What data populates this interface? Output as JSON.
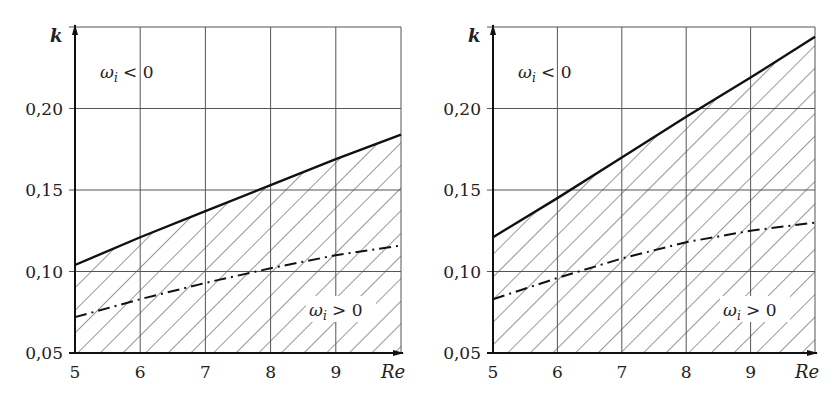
{
  "chart_data": [
    {
      "type": "line",
      "title": "",
      "xlabel": "Re",
      "ylabel": "k",
      "xlim": [
        5,
        10
      ],
      "ylim": [
        0.05,
        0.25
      ],
      "x_ticks": [
        "5",
        "6",
        "7",
        "8",
        "9"
      ],
      "y_ticks": [
        "0,05",
        "0,10",
        "0,15",
        "0,20"
      ],
      "grid": true,
      "annotations": [
        "ωi < 0",
        "ωi > 0"
      ],
      "series": [
        {
          "name": "neutral stability boundary (solid)",
          "style": "solid",
          "x": [
            5,
            6,
            7,
            8,
            9,
            10
          ],
          "values": [
            0.104,
            0.121,
            0.137,
            0.153,
            0.169,
            0.184
          ]
        },
        {
          "name": "dash-dot curve",
          "style": "dashdot",
          "x": [
            5,
            6,
            7,
            8,
            9,
            10
          ],
          "values": [
            0.072,
            0.083,
            0.093,
            0.102,
            0.11,
            0.116
          ]
        }
      ],
      "hatched_region": "below solid line (ωi > 0)"
    },
    {
      "type": "line",
      "title": "",
      "xlabel": "Re",
      "ylabel": "k",
      "xlim": [
        5,
        10
      ],
      "ylim": [
        0.05,
        0.25
      ],
      "x_ticks": [
        "5",
        "6",
        "7",
        "8",
        "9"
      ],
      "y_ticks": [
        "0,05",
        "0,10",
        "0,15",
        "0,20"
      ],
      "grid": true,
      "annotations": [
        "ωi < 0",
        "ωi > 0"
      ],
      "series": [
        {
          "name": "neutral stability boundary (solid)",
          "style": "solid",
          "x": [
            5,
            6,
            7,
            8,
            9,
            10
          ],
          "values": [
            0.121,
            0.145,
            0.17,
            0.195,
            0.219,
            0.244
          ]
        },
        {
          "name": "dash-dot curve",
          "style": "dashdot",
          "x": [
            5,
            6,
            7,
            8,
            9,
            10
          ],
          "values": [
            0.083,
            0.096,
            0.108,
            0.118,
            0.125,
            0.13
          ]
        }
      ],
      "hatched_region": "below solid line (ωi > 0)"
    }
  ],
  "labels": {
    "left": {
      "k": "k",
      "re": "Re",
      "stable": "ωi < 0",
      "unstable": "ωi > 0"
    },
    "right": {
      "k": "k",
      "re": "Re",
      "stable": "ωi < 0",
      "unstable": "ωi > 0"
    }
  }
}
